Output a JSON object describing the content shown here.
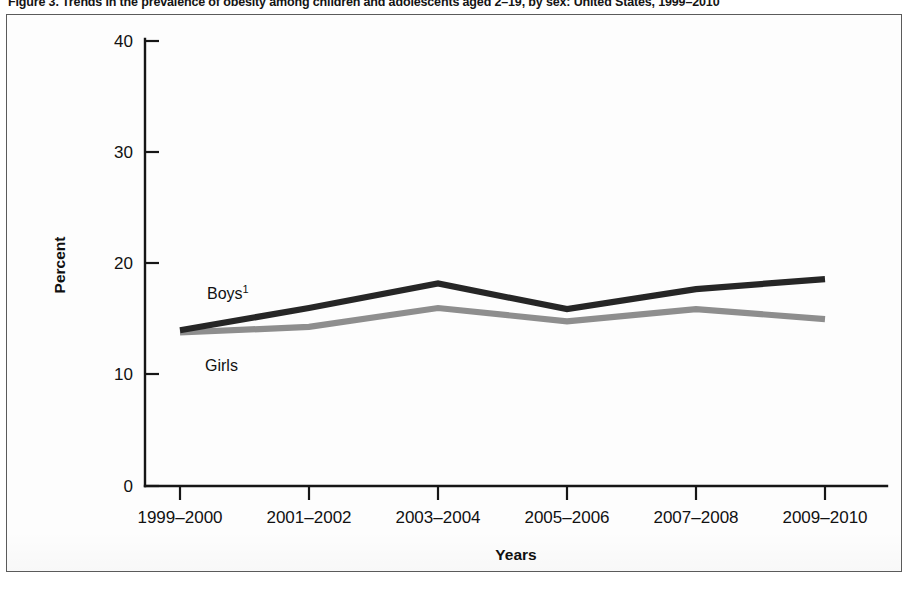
{
  "figure": {
    "caption": "Figure 3. Trends in the prevalence of obesity among children and adolescents aged 2–19, by sex: United States, 1999–2010"
  },
  "chart_data": {
    "type": "line",
    "title": "Trends in the prevalence of obesity among children and adolescents aged 2–19, by sex: United States, 1999–2010",
    "xlabel": "Years",
    "ylabel": "Percent",
    "categories": [
      "1999–2000",
      "2001–2002",
      "2003–2004",
      "2005–2006",
      "2007–2008",
      "2009–2010"
    ],
    "series": [
      {
        "name": "Boys",
        "label": "Boys",
        "superscript": "1",
        "color": "#262626",
        "values": [
          14.0,
          16.0,
          18.2,
          15.9,
          17.7,
          18.6
        ]
      },
      {
        "name": "Girls",
        "label": "Girls",
        "superscript": "",
        "color": "#8e8e8e",
        "values": [
          13.8,
          14.3,
          16.0,
          14.8,
          15.9,
          15.0
        ]
      }
    ],
    "ylim": [
      0,
      40
    ],
    "yticks": [
      0,
      10,
      20,
      30,
      40
    ],
    "ytick_labels": [
      "0",
      "10",
      "20",
      "30",
      "40"
    ],
    "grid": false,
    "legend_position": "inline-annotations",
    "annotations": [
      {
        "text": "Boys",
        "superscript": "1",
        "series": "Boys"
      },
      {
        "text": "Girls",
        "superscript": "",
        "series": "Girls"
      }
    ]
  }
}
